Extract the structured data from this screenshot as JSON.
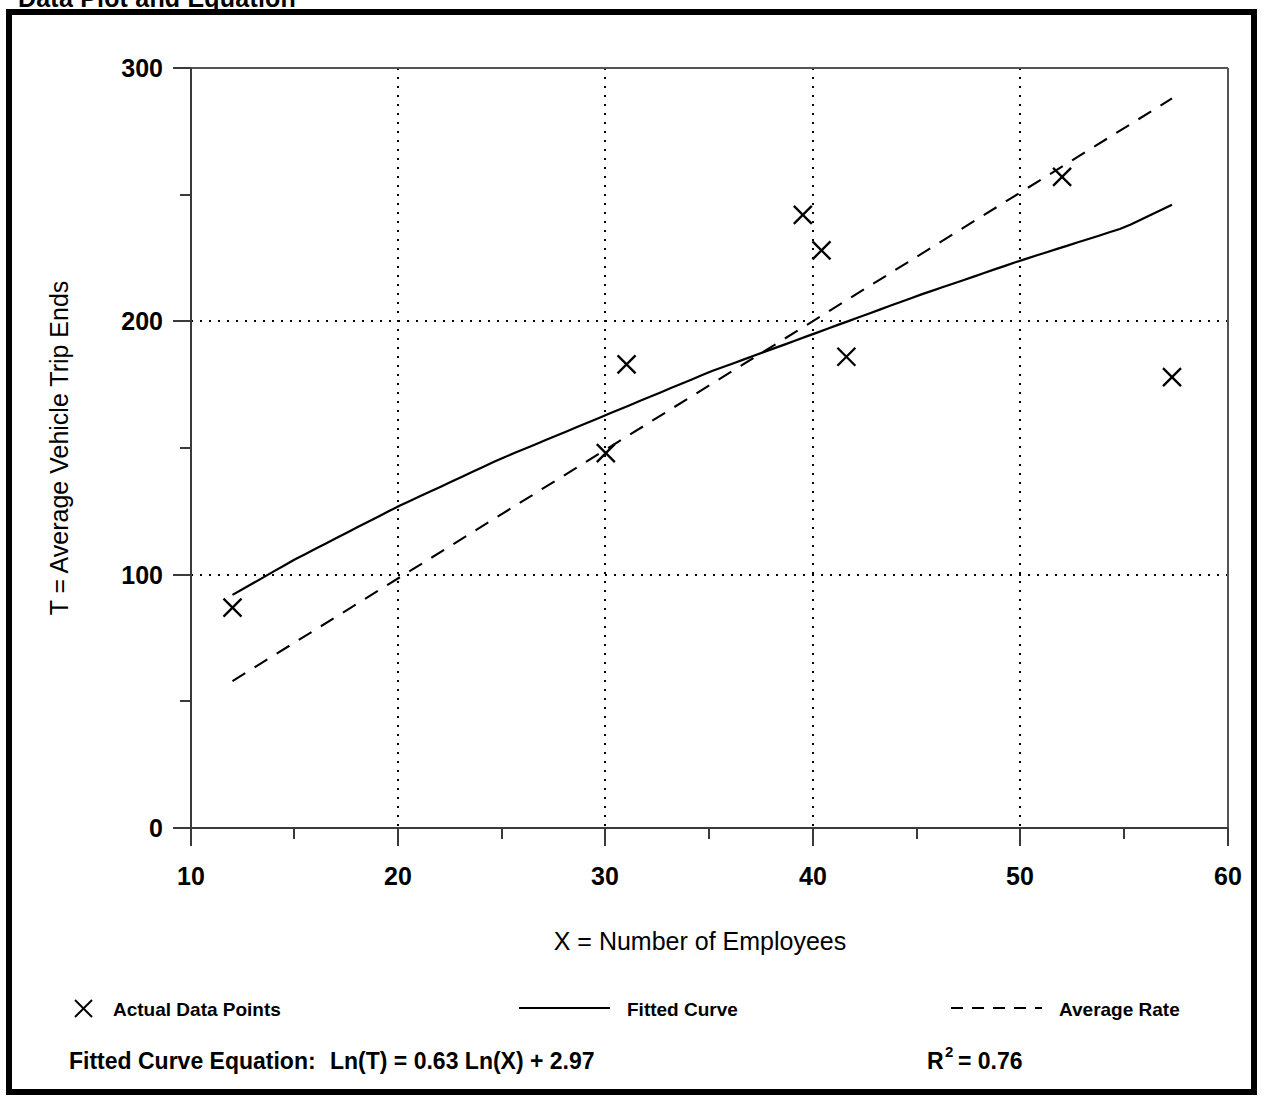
{
  "figure": {
    "title": "Data Plot and Equation"
  },
  "chart_data": {
    "type": "scatter",
    "title": "Data Plot and Equation",
    "xlabel": "X = Number of Employees",
    "ylabel": "T = Average Vehicle Trip Ends",
    "xlim": [
      10,
      60
    ],
    "ylim": [
      0,
      300
    ],
    "x_ticks": [
      10,
      20,
      30,
      40,
      50,
      60
    ],
    "x_tick_labels": [
      "10",
      "20",
      "30",
      "40",
      "50",
      "60"
    ],
    "x_minor_ticks": [
      15,
      25,
      35,
      45,
      55
    ],
    "y_ticks": [
      0,
      100,
      200,
      300
    ],
    "y_tick_labels": [
      "0",
      "100",
      "200",
      "300"
    ],
    "y_minor_ticks": [
      50,
      150,
      250
    ],
    "grid": "dotted vertical at x=20,30,40,50 and dotted horizontal at y=100,200",
    "legend_position": "below-axis",
    "series": [
      {
        "name": "Actual Data Points",
        "type": "scatter",
        "marker": "x",
        "points": [
          {
            "x": 12.0,
            "y": 87
          },
          {
            "x": 30.0,
            "y": 148
          },
          {
            "x": 31.0,
            "y": 183
          },
          {
            "x": 39.5,
            "y": 242
          },
          {
            "x": 40.4,
            "y": 228
          },
          {
            "x": 41.6,
            "y": 186
          },
          {
            "x": 52.0,
            "y": 257
          },
          {
            "x": 57.3,
            "y": 178
          }
        ]
      },
      {
        "name": "Fitted Curve",
        "type": "line",
        "style": "solid",
        "equation": "Ln(T) = 0.63 Ln(X) + 2.97",
        "points": [
          {
            "x": 12.0,
            "y": 92
          },
          {
            "x": 15.0,
            "y": 106
          },
          {
            "x": 20.0,
            "y": 127
          },
          {
            "x": 25.0,
            "y": 146
          },
          {
            "x": 30.0,
            "y": 163
          },
          {
            "x": 35.0,
            "y": 180
          },
          {
            "x": 40.0,
            "y": 195
          },
          {
            "x": 45.0,
            "y": 210
          },
          {
            "x": 50.0,
            "y": 224
          },
          {
            "x": 55.0,
            "y": 237
          },
          {
            "x": 57.3,
            "y": 246
          }
        ]
      },
      {
        "name": "Average Rate",
        "type": "line",
        "style": "dashed",
        "points": [
          {
            "x": 12.0,
            "y": 58
          },
          {
            "x": 57.3,
            "y": 288
          }
        ]
      }
    ]
  },
  "legend": {
    "items": [
      {
        "label": "Actual Data Points",
        "marker": "x-marker"
      },
      {
        "label": "Fitted Curve",
        "marker": "solid-line"
      },
      {
        "label": "Average Rate",
        "marker": "dashed-line"
      }
    ]
  },
  "equation_row": {
    "fitted_label": "Fitted Curve Equation:",
    "fitted_equation": "Ln(T) = 0.63 Ln(X) + 2.97",
    "r_squared_base": "R",
    "r_squared_exp": "2",
    "r_squared_value": "= 0.76"
  }
}
